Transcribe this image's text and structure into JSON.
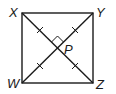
{
  "diagram": {
    "type": "square-with-diagonals",
    "vertices": {
      "X": {
        "label": "X",
        "x": 22,
        "y": 13
      },
      "Y": {
        "label": "Y",
        "x": 93,
        "y": 13
      },
      "Z": {
        "label": "Z",
        "x": 93,
        "y": 83
      },
      "W": {
        "label": "W",
        "x": 22,
        "y": 83
      }
    },
    "intersection": {
      "label": "P",
      "x": 57.5,
      "y": 48
    },
    "right_angle_at": "P",
    "congruent_segments": [
      "XP",
      "YP",
      "WP",
      "ZP"
    ],
    "stroke_color": "#1a1a1a"
  }
}
